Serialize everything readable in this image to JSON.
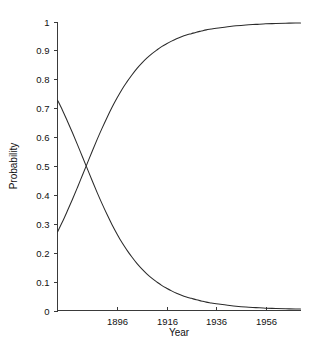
{
  "chart_data": {
    "type": "line",
    "title": "",
    "xlabel": "Year",
    "ylabel": "Probability",
    "xlim": [
      1872,
      1970
    ],
    "ylim": [
      0,
      1
    ],
    "grid": false,
    "legend": null,
    "xticks": [
      1896,
      1916,
      1936,
      1956
    ],
    "xtick_labels": [
      "1896",
      "1916",
      "1936",
      "1956"
    ],
    "yticks": [
      0,
      0.1,
      0.2,
      0.3,
      0.4,
      0.5,
      0.6,
      0.7,
      0.8,
      0.9,
      1
    ],
    "ytick_labels": [
      "0",
      "0.1",
      "0.2",
      "0.3",
      "0.4",
      "0.5",
      "0.6",
      "0.7",
      "0.8",
      "0.9",
      "1"
    ],
    "line_color": "#2b2b2b",
    "series": [
      {
        "name": "rising-probability",
        "x": [
          1872,
          1874,
          1876,
          1878,
          1880,
          1882,
          1884,
          1886,
          1888,
          1890,
          1892,
          1894,
          1896,
          1898,
          1900,
          1902,
          1904,
          1906,
          1908,
          1910,
          1912,
          1914,
          1916,
          1918,
          1920,
          1922,
          1924,
          1926,
          1928,
          1930,
          1932,
          1934,
          1936,
          1940,
          1944,
          1948,
          1952,
          1956,
          1960,
          1964,
          1968,
          1970
        ],
        "values": [
          0.272,
          0.307,
          0.345,
          0.384,
          0.425,
          0.467,
          0.509,
          0.551,
          0.592,
          0.631,
          0.668,
          0.703,
          0.735,
          0.765,
          0.791,
          0.815,
          0.837,
          0.856,
          0.873,
          0.888,
          0.901,
          0.913,
          0.923,
          0.932,
          0.94,
          0.947,
          0.953,
          0.958,
          0.963,
          0.967,
          0.971,
          0.974,
          0.977,
          0.981,
          0.985,
          0.988,
          0.99,
          0.992,
          0.993,
          0.994,
          0.995,
          0.995
        ]
      },
      {
        "name": "falling-probability",
        "x": [
          1872,
          1874,
          1876,
          1878,
          1880,
          1882,
          1884,
          1886,
          1888,
          1890,
          1892,
          1894,
          1896,
          1898,
          1900,
          1902,
          1904,
          1906,
          1908,
          1910,
          1912,
          1914,
          1916,
          1918,
          1920,
          1922,
          1924,
          1926,
          1928,
          1930,
          1932,
          1934,
          1936,
          1940,
          1944,
          1948,
          1952,
          1956,
          1960,
          1964,
          1968,
          1970
        ],
        "values": [
          0.728,
          0.693,
          0.655,
          0.616,
          0.575,
          0.533,
          0.491,
          0.449,
          0.408,
          0.369,
          0.332,
          0.297,
          0.265,
          0.235,
          0.209,
          0.185,
          0.163,
          0.144,
          0.127,
          0.112,
          0.099,
          0.087,
          0.077,
          0.068,
          0.06,
          0.053,
          0.047,
          0.042,
          0.037,
          0.033,
          0.029,
          0.026,
          0.023,
          0.019,
          0.015,
          0.012,
          0.01,
          0.008,
          0.007,
          0.006,
          0.005,
          0.005
        ]
      }
    ],
    "crossing_point": {
      "x": 1884.5,
      "y": 0.5
    }
  }
}
